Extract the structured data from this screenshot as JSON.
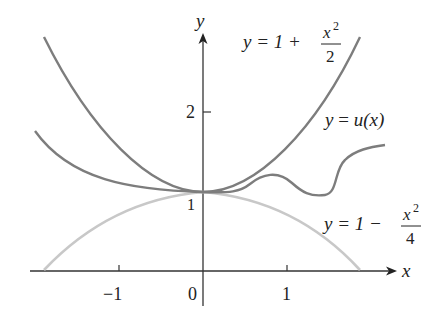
{
  "figure": {
    "axes": {
      "x_label": "x",
      "y_label": "y",
      "x_ticks": [
        {
          "value": -1,
          "label": "−1"
        },
        {
          "value": 0,
          "label": "0"
        },
        {
          "value": 1,
          "label": "1"
        }
      ],
      "y_ticks": [
        {
          "value": 1,
          "label": "1"
        },
        {
          "value": 2,
          "label": "2"
        }
      ]
    },
    "curves": [
      {
        "id": "upper",
        "label_prefix": "y = 1 + ",
        "label_num": "x",
        "label_exp": "2",
        "label_den": "2",
        "color": "#7a7a7a"
      },
      {
        "id": "middle",
        "label": "y = u(x)",
        "label_y": "y",
        "label_eq": " = ",
        "label_fn": "u(x)",
        "color": "#7a7a7a"
      },
      {
        "id": "lower",
        "label_prefix": "y = 1 − ",
        "label_num": "x",
        "label_exp": "2",
        "label_den": "4",
        "color": "#c4c4c4"
      }
    ]
  }
}
